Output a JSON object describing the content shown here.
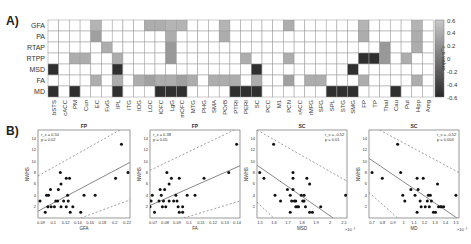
{
  "panel_a_label": "A)",
  "panel_b_label": "B)",
  "chart_data": [
    {
      "type": "heatmap",
      "title": "",
      "rows": [
        "GFA",
        "PA",
        "RTAP",
        "RTPP",
        "MSD",
        "FA",
        "MD"
      ],
      "columns": [
        "bSTS",
        "cACC",
        "PM",
        "Cun",
        "EC",
        "FuG",
        "IPL",
        "ITG",
        "IOG",
        "LOC",
        "lOFC",
        "LgG",
        "mOFC",
        "MTG",
        "PHG",
        "SMA",
        "POrB",
        "PTRI",
        "PERI",
        "SC",
        "PCC",
        "M1",
        "PCN",
        "rACC",
        "rMFG",
        "SFG",
        "SPL",
        "STG",
        "SMG",
        "FP",
        "TP",
        "Thal",
        "Cau",
        "Put",
        "Hipp",
        "Amg"
      ],
      "values": [
        [
          0,
          0,
          0,
          0,
          0.45,
          0,
          0,
          0,
          0,
          0.4,
          0.4,
          0.45,
          0.45,
          0,
          0,
          0,
          0.45,
          0,
          0,
          0,
          0,
          0,
          0.4,
          0,
          0,
          0,
          0,
          0,
          0,
          0.45,
          0,
          0,
          0,
          0,
          0.45,
          0
        ],
        [
          0,
          0,
          0,
          0,
          0.3,
          0,
          0,
          0,
          0,
          0,
          0,
          0.4,
          0,
          0,
          0,
          0,
          0.4,
          0,
          0,
          0,
          0,
          0,
          0,
          0,
          0,
          0,
          0,
          0,
          0,
          0.4,
          0,
          0,
          0,
          0,
          0.4,
          0
        ],
        [
          0,
          0,
          0,
          0,
          0,
          0.4,
          0,
          0,
          0,
          0,
          0,
          0.25,
          0,
          0,
          0,
          0,
          0,
          0,
          0,
          0,
          0,
          0,
          0,
          0,
          0,
          0,
          0,
          0,
          0,
          0,
          0,
          0.25,
          0,
          0,
          0.4,
          0
        ],
        [
          0,
          0,
          0.4,
          0.4,
          0,
          0,
          0.4,
          0,
          0,
          0,
          0,
          0.25,
          0,
          0,
          0,
          0,
          0,
          0,
          0.4,
          0,
          0,
          0,
          0.4,
          0,
          0,
          0,
          0,
          0,
          0,
          -0.55,
          -0.55,
          0.25,
          0,
          0.4,
          0,
          0
        ],
        [
          -0.55,
          0,
          0,
          0,
          0,
          0,
          -0.55,
          0,
          0,
          0,
          0,
          0,
          0,
          0,
          0,
          0,
          0,
          0,
          0,
          -0.55,
          0,
          0,
          0,
          0,
          0,
          0,
          0,
          0,
          -0.55,
          0,
          0,
          0,
          0,
          0,
          0,
          0
        ],
        [
          0,
          0,
          0,
          0,
          0.4,
          0,
          0.4,
          0,
          0.4,
          0.3,
          0.4,
          0.4,
          0.3,
          0.4,
          0,
          0.4,
          0.4,
          0.4,
          0,
          0.4,
          0,
          0,
          0.3,
          0,
          0.4,
          0.4,
          0,
          0,
          0,
          0.4,
          0,
          0,
          0,
          0,
          0.4,
          0
        ],
        [
          -0.55,
          0,
          -0.55,
          0,
          0,
          0,
          -0.55,
          0,
          0,
          0,
          -0.55,
          -0.55,
          -0.55,
          0,
          0,
          0,
          0,
          -0.55,
          -0.55,
          -0.55,
          0,
          0,
          0,
          0,
          0,
          0,
          -0.55,
          -0.55,
          -0.55,
          0,
          0,
          0,
          -0.55,
          0,
          0,
          0
        ]
      ],
      "colorbar": {
        "label": "r_s value",
        "ticks": [
          0.6,
          0.4,
          0.2,
          0,
          -0.2,
          -0.4,
          -0.6
        ],
        "range": [
          -0.6,
          0.6
        ]
      }
    },
    {
      "type": "scatter",
      "title": "FP",
      "xlabel": "GFA",
      "ylabel": "NWHS",
      "annotation": [
        "r_s = 0.50",
        "p = 0.02"
      ],
      "xticks": [
        "0.09",
        "0.1",
        "0.12",
        "0.14",
        "0.16",
        "0.18",
        "0.2",
        "0.22"
      ],
      "xlim": [
        0.085,
        0.225
      ],
      "yticks": [
        2,
        4,
        6,
        8,
        10,
        12,
        14
      ],
      "ylim": [
        0,
        15.5
      ],
      "points": [
        [
          0.088,
          3
        ],
        [
          0.096,
          1
        ],
        [
          0.098,
          4
        ],
        [
          0.1,
          2
        ],
        [
          0.101,
          4
        ],
        [
          0.104,
          5
        ],
        [
          0.105,
          2
        ],
        [
          0.11,
          2
        ],
        [
          0.112,
          3
        ],
        [
          0.115,
          3
        ],
        [
          0.116,
          5
        ],
        [
          0.119,
          8
        ],
        [
          0.12,
          6
        ],
        [
          0.12,
          2
        ],
        [
          0.124,
          3
        ],
        [
          0.128,
          7
        ],
        [
          0.133,
          7
        ],
        [
          0.128,
          2
        ],
        [
          0.13,
          4
        ],
        [
          0.131,
          3
        ],
        [
          0.134,
          1
        ],
        [
          0.138,
          2
        ],
        [
          0.15,
          1
        ],
        [
          0.155,
          4
        ],
        [
          0.172,
          4
        ],
        [
          0.203,
          7
        ],
        [
          0.212,
          13
        ],
        [
          0.222,
          8
        ]
      ],
      "fit": [
        [
          0.085,
          1.2
        ],
        [
          0.225,
          9.8
        ]
      ],
      "ci_upper": [
        [
          0.085,
          7.4
        ],
        [
          0.225,
          16.5
        ]
      ],
      "ci_lower": [
        [
          0.15,
          0
        ],
        [
          0.225,
          3.2
        ]
      ]
    },
    {
      "type": "scatter",
      "title": "FP",
      "xlabel": "FA",
      "ylabel": "NWHS",
      "annotation": [
        "r_s = 0.38",
        "p = 0.05"
      ],
      "xticks": [
        "0.07",
        "0.08",
        "0.09",
        "0.1",
        "0.11",
        "0.12",
        "0.13",
        "0.14"
      ],
      "xlim": [
        0.065,
        0.145
      ],
      "yticks": [
        2,
        4,
        6,
        8,
        10,
        12,
        14
      ],
      "ylim": [
        0,
        15.5
      ],
      "points": [
        [
          0.065,
          2
        ],
        [
          0.066,
          3
        ],
        [
          0.067,
          4
        ],
        [
          0.069,
          1
        ],
        [
          0.073,
          3
        ],
        [
          0.074,
          5
        ],
        [
          0.075,
          4
        ],
        [
          0.076,
          2
        ],
        [
          0.077,
          3
        ],
        [
          0.078,
          5
        ],
        [
          0.079,
          2
        ],
        [
          0.08,
          8
        ],
        [
          0.082,
          6
        ],
        [
          0.082,
          3
        ],
        [
          0.084,
          7
        ],
        [
          0.086,
          3
        ],
        [
          0.088,
          4
        ],
        [
          0.089,
          3
        ],
        [
          0.09,
          2
        ],
        [
          0.091,
          7
        ],
        [
          0.091,
          1
        ],
        [
          0.094,
          2
        ],
        [
          0.094,
          1
        ],
        [
          0.098,
          4
        ],
        [
          0.105,
          4
        ],
        [
          0.113,
          7
        ],
        [
          0.135,
          8
        ],
        [
          0.142,
          13
        ]
      ],
      "fit": [
        [
          0.065,
          2.2
        ],
        [
          0.145,
          9.2
        ]
      ],
      "ci_upper": [
        [
          0.065,
          8.4
        ],
        [
          0.145,
          16
        ]
      ],
      "ci_lower": [
        [
          0.095,
          0
        ],
        [
          0.145,
          3
        ]
      ]
    },
    {
      "type": "scatter",
      "title": "SC",
      "xlabel": "MSD",
      "ylabel": "NWHS",
      "annotation": [
        "r_s = -0.52",
        "p = 0.01"
      ],
      "x_multiplier": "×10⁻³",
      "xticks": [
        "1.5",
        "1.6",
        "1.7",
        "1.8",
        "1.9",
        "2",
        "2.1"
      ],
      "xlim": [
        1.5,
        2.15
      ],
      "yticks": [
        2,
        4,
        6,
        8,
        10,
        12,
        14
      ],
      "ylim": [
        0,
        15.5
      ],
      "points": [
        [
          1.52,
          8
        ],
        [
          1.55,
          7
        ],
        [
          1.62,
          13
        ],
        [
          1.63,
          4
        ],
        [
          1.67,
          3
        ],
        [
          1.72,
          5
        ],
        [
          1.76,
          8
        ],
        [
          1.76,
          5
        ],
        [
          1.76,
          7
        ],
        [
          1.74,
          4
        ],
        [
          1.74,
          1
        ],
        [
          1.75,
          3
        ],
        [
          1.77,
          3
        ],
        [
          1.78,
          2
        ],
        [
          1.79,
          2
        ],
        [
          1.78,
          3
        ],
        [
          1.8,
          2
        ],
        [
          1.82,
          4
        ],
        [
          1.83,
          3
        ],
        [
          1.84,
          4
        ],
        [
          1.84,
          3
        ],
        [
          1.85,
          2
        ],
        [
          1.86,
          7
        ],
        [
          1.88,
          6
        ],
        [
          1.88,
          1
        ],
        [
          1.9,
          1
        ],
        [
          1.96,
          2
        ],
        [
          2.14,
          4
        ]
      ],
      "fit": [
        [
          1.5,
          9.3
        ],
        [
          2.05,
          0
        ]
      ],
      "ci_upper": [
        [
          1.5,
          15.5
        ],
        [
          2.15,
          6.5
        ]
      ],
      "ci_lower": [
        [
          1.5,
          2.8
        ],
        [
          1.62,
          0
        ]
      ]
    },
    {
      "type": "scatter",
      "title": "SC",
      "xlabel": "MD",
      "ylabel": "NWHS",
      "annotation": [
        "r_s = -0.52",
        "p = 0.004"
      ],
      "x_multiplier": "×10⁻³",
      "xticks": [
        "0.7",
        "0.8",
        "0.9",
        "1",
        "1.1",
        "1.2",
        "1.3",
        "1.4",
        "1.5"
      ],
      "xlim": [
        0.67,
        1.55
      ],
      "yticks": [
        2,
        4,
        6,
        8,
        10,
        12,
        14
      ],
      "ylim": [
        0,
        15.5
      ],
      "points": [
        [
          0.7,
          8
        ],
        [
          0.8,
          7
        ],
        [
          0.95,
          13
        ],
        [
          0.98,
          8
        ],
        [
          1.0,
          4
        ],
        [
          1.02,
          3
        ],
        [
          1.08,
          5
        ],
        [
          1.12,
          4
        ],
        [
          1.14,
          7
        ],
        [
          1.14,
          1
        ],
        [
          1.15,
          5
        ],
        [
          1.17,
          3
        ],
        [
          1.2,
          7
        ],
        [
          1.18,
          2
        ],
        [
          1.24,
          3
        ],
        [
          1.25,
          4
        ],
        [
          1.26,
          2
        ],
        [
          1.27,
          4
        ],
        [
          1.28,
          3
        ],
        [
          1.3,
          1
        ],
        [
          1.32,
          1
        ],
        [
          1.34,
          6
        ],
        [
          1.35,
          2
        ],
        [
          1.37,
          2
        ],
        [
          1.38,
          2
        ],
        [
          1.4,
          2
        ],
        [
          1.52,
          4
        ],
        [
          1.22,
          2
        ]
      ],
      "fit": [
        [
          0.67,
          10.5
        ],
        [
          1.53,
          0
        ]
      ],
      "ci_upper": [
        [
          0.67,
          16.5
        ],
        [
          1.55,
          8
        ]
      ],
      "ci_lower": [
        [
          0.67,
          4.5
        ],
        [
          0.95,
          0
        ]
      ]
    }
  ]
}
